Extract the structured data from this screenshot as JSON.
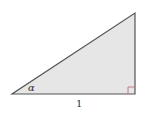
{
  "diagram": {
    "type": "right-triangle",
    "vertices": {
      "bottom_left": [
        12,
        94
      ],
      "bottom_right": [
        135,
        94
      ],
      "top": [
        135,
        13
      ]
    },
    "labels": {
      "angle": "α",
      "base": "1"
    },
    "right_angle_marker": {
      "position": "bottom-right",
      "size": 7
    },
    "colors": {
      "fill": "#e6e6e6",
      "stroke": "#555555",
      "right_angle_marker": "#c0707a",
      "text": "#333333"
    }
  }
}
